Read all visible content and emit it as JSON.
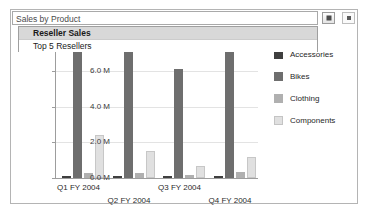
{
  "report_viewer": {
    "parameter": {
      "label": "Sales by Product",
      "dropdown_open": true,
      "options": [
        "Reseller Sales",
        "Top 5 Resellers"
      ],
      "selected": "Reseller Sales"
    },
    "combo_button_icon": "dropdown-arrow-icon",
    "secondary_button_icon": "dropdown-arrow-icon"
  },
  "chart_data": {
    "type": "bar",
    "title": "",
    "xlabel": "",
    "ylabel": "",
    "categories": [
      "Q1 FY 2004",
      "Q2 FY 2004",
      "Q3 FY 2004",
      "Q4 FY 2004"
    ],
    "ytick_labels": [
      "0.0 M",
      "2.0 M",
      "4.0 M",
      "6.0 M"
    ],
    "ytick_values": [
      0,
      2000000,
      4000000,
      6000000
    ],
    "ylim": [
      0,
      8000000
    ],
    "grid": true,
    "legend_position": "right",
    "series": [
      {
        "name": "Accessories",
        "color": "#3f3f3f",
        "values": [
          120000,
          130000,
          110000,
          140000
        ]
      },
      {
        "name": "Bikes",
        "color": "#6e6e6e",
        "values": [
          7900000,
          7800000,
          6100000,
          7050000
        ]
      },
      {
        "name": "Clothing",
        "color": "#b0b0b0",
        "values": [
          300000,
          260000,
          190000,
          360000
        ]
      },
      {
        "name": "Components",
        "color": "#e0e0e0",
        "values": [
          2400000,
          1520000,
          700000,
          1170000
        ]
      }
    ]
  }
}
